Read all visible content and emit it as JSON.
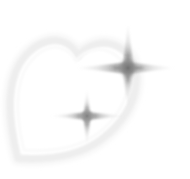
{
  "artwork": {
    "title": "Heart with sparkles",
    "kind": "decorative-graphic",
    "canvas": {
      "width": 190,
      "height": 179,
      "background": "#ffffff"
    },
    "palette": {
      "background": "#ffffff",
      "heart_outline": "#eeeeee",
      "heart_outline_soft": "#f6f6f6",
      "heart_fill": "#ffffff",
      "sparkle_core": "#7a7a7a",
      "sparkle_mid": "#a8a8a8",
      "sparkle_tip": "#d8d8d8"
    },
    "elements": [
      {
        "name": "heart",
        "label": "Heart outline",
        "center_x": 78,
        "center_y": 95,
        "rotation_deg": -18,
        "stroke_color": "#eeeeee",
        "stroke_width": 7,
        "top_y": 40,
        "bottom_tip_x": 18,
        "bottom_tip_y": 158
      },
      {
        "name": "sparkle-large",
        "label": "Large sparkle",
        "center_x": 128,
        "center_y": 68,
        "spike_up": 46,
        "spike_down": 42,
        "spike_left": 53,
        "spike_right": 48,
        "core_radius": 13,
        "core_color": "#7a7a7a"
      },
      {
        "name": "sparkle-small",
        "label": "Small sparkle",
        "center_x": 87,
        "center_y": 116,
        "spike_up": 27,
        "spike_down": 30,
        "spike_left": 37,
        "spike_right": 38,
        "core_radius": 9,
        "core_color": "#8a8a8a"
      }
    ]
  }
}
